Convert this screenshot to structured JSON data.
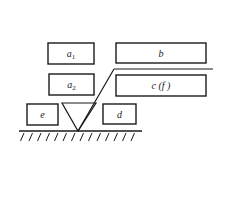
{
  "diagram": {
    "stroke_color": "#1a1a1a",
    "background": "#ffffff",
    "boxes": [
      {
        "id": "a1",
        "label": "a",
        "subscript": "1",
        "x": 48,
        "y": 43,
        "w": 46,
        "h": 21
      },
      {
        "id": "a2",
        "label": "a",
        "subscript": "2",
        "x": 49,
        "y": 74,
        "w": 45,
        "h": 21
      },
      {
        "id": "b",
        "label": "b",
        "subscript": "",
        "x": 116,
        "y": 43,
        "w": 90,
        "h": 20
      },
      {
        "id": "cf",
        "label": "c (f )",
        "subscript": "",
        "x": 116,
        "y": 75,
        "w": 90,
        "h": 21
      },
      {
        "id": "e",
        "label": "e",
        "subscript": "",
        "x": 27,
        "y": 104,
        "w": 31,
        "h": 21
      },
      {
        "id": "d",
        "label": "d",
        "subscript": "",
        "x": 103,
        "y": 104,
        "w": 33,
        "h": 20
      }
    ],
    "triangle": {
      "top_left": [
        62,
        103
      ],
      "top_right": [
        96,
        103
      ],
      "apex": [
        78,
        131
      ]
    },
    "slanted_line": {
      "from": [
        78,
        131
      ],
      "to": [
        114,
        69
      ]
    },
    "horizontal_line": {
      "from": [
        114,
        69
      ],
      "to": [
        213,
        69
      ]
    },
    "ground": {
      "x1": 19,
      "x2": 142,
      "y": 131,
      "hatch_start": 24,
      "hatch_end": 138,
      "hatch_spacing": 8.5
    }
  }
}
